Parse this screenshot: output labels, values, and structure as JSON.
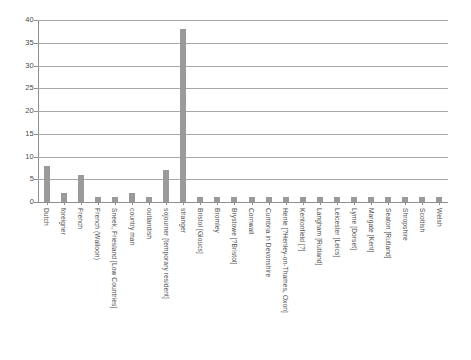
{
  "chart_data": {
    "type": "bar",
    "title": "",
    "subtitle": "",
    "xlabel": "",
    "ylabel": "",
    "ylim": [
      0,
      40
    ],
    "ytick_labels": [
      "0",
      "5",
      "10",
      "15",
      "20",
      "25",
      "30",
      "35",
      "40"
    ],
    "ytick_values": [
      0,
      5,
      10,
      15,
      20,
      25,
      30,
      35,
      40
    ],
    "grid": true,
    "legend": false,
    "bar_color": "#9a9a9a",
    "gridline_color": "#a8a8a8",
    "axis_color": "#8f8f8f",
    "categories": [
      "Dutch",
      "foreigner",
      "French",
      "French (Walloon)",
      "Sneek, Friesland [Low Countries]",
      "country man",
      "outlandish",
      "sojourner [temporary resident]",
      "stranger",
      "Bristol [Gloucs]",
      "Bromley",
      "Brystowe [?Bristol]",
      "Cornwall",
      "Cumbria in Devonshire",
      "Henle [?Henley-on-Thames, Oxon]",
      "Kentonfield [?]",
      "Langham [Rutland]",
      "Leicester [Leics]",
      "Lyme [Dorset]",
      "Margate [Kent]",
      "Seaton [Rutland]",
      "Shropshire",
      "Scottish",
      "Welsh"
    ],
    "values": [
      8,
      2,
      6,
      1,
      1,
      2,
      1,
      7,
      38,
      1,
      1,
      1,
      1,
      1,
      1,
      1,
      1,
      1,
      1,
      1,
      1,
      1,
      1,
      1
    ]
  }
}
